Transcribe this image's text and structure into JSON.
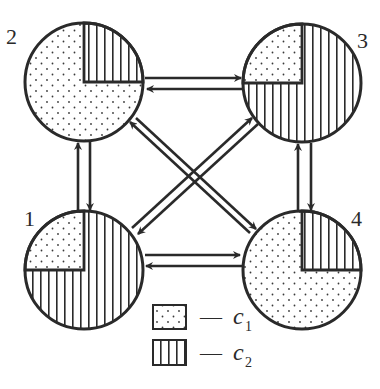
{
  "diagram": {
    "type": "node-state-transition",
    "colors": {
      "stroke": "#2a2a2a",
      "background": "#ffffff"
    },
    "nodes": [
      {
        "id": "1",
        "label": "1",
        "cx": 84,
        "cy": 270,
        "r": 59,
        "c1_quadrant": "top-left",
        "c2_fraction": 0.75,
        "c1_fraction": 0.25
      },
      {
        "id": "2",
        "label": "2",
        "cx": 84,
        "cy": 82,
        "r": 59,
        "c2_quadrant": "top-right",
        "c1_fraction": 0.75,
        "c2_fraction": 0.25
      },
      {
        "id": "3",
        "label": "3",
        "cx": 302,
        "cy": 83,
        "r": 59,
        "c1_quadrant": "top-left",
        "c2_fraction": 0.75,
        "c1_fraction": 0.25
      },
      {
        "id": "4",
        "label": "4",
        "cx": 302,
        "cy": 270,
        "r": 59,
        "c2_quadrant": "top-right",
        "c1_fraction": 0.75,
        "c2_fraction": 0.25
      }
    ],
    "edges": [
      {
        "between": [
          "2",
          "3"
        ],
        "bidirectional": true
      },
      {
        "between": [
          "1",
          "4"
        ],
        "bidirectional": true
      },
      {
        "between": [
          "1",
          "2"
        ],
        "bidirectional": true
      },
      {
        "between": [
          "3",
          "4"
        ],
        "bidirectional": true
      },
      {
        "between": [
          "1",
          "3"
        ],
        "bidirectional": true
      },
      {
        "between": [
          "2",
          "4"
        ],
        "bidirectional": true
      }
    ],
    "legend": {
      "items": [
        {
          "pattern": "dotted",
          "dash": "—",
          "symbol": "c",
          "subscript": "1"
        },
        {
          "pattern": "vertical-stripes",
          "dash": "—",
          "symbol": "c",
          "subscript": "2"
        }
      ]
    }
  }
}
